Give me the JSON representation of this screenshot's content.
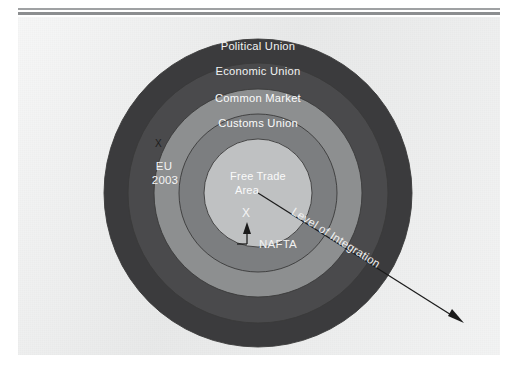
{
  "figure": {
    "type": "concentric-rings-diagram",
    "center": {
      "x": 240,
      "y": 176
    },
    "rings": [
      {
        "id": "political-union",
        "label": "Political Union",
        "radius": 154,
        "fill": "#3b3b3d",
        "label_y": 29
      },
      {
        "id": "economic-union",
        "label": "Economic Union",
        "radius": 130,
        "fill": "#4a4a4c",
        "label_y": 54
      },
      {
        "id": "common-market",
        "label": "Common Market",
        "radius": 104,
        "fill": "#8d8f90",
        "label_y": 81
      },
      {
        "id": "customs-union",
        "label": "Customs Union",
        "radius": 79,
        "fill": "#7c7e80",
        "label_y": 106
      },
      {
        "id": "free-trade-area",
        "label": "Free Trade Area",
        "radius": 54,
        "fill": "#bfc1c2",
        "label_y": 0
      }
    ],
    "center_label_line1": "Free Trade",
    "center_label_line2": "Area",
    "center_marker": "X",
    "annotations": [
      {
        "id": "eu-2003",
        "line1": "EU",
        "line2": "2003",
        "marker": "X",
        "x": 117,
        "y": 139
      },
      {
        "id": "nafta",
        "label": "NAFTA",
        "x": 195,
        "y": 223
      },
      {
        "id": "level-of-integration",
        "label": "Level of Integration",
        "rotation_deg": 32
      }
    ],
    "colors": {
      "page": "#eceded",
      "ring_outer": "#3b3b3d",
      "ring_second": "#4a4a4c",
      "ring_third": "#8d8f90",
      "ring_fourth": "#7c7e80",
      "ring_center": "#bfc1c2",
      "label_text": "#f2f3f3",
      "rule": "#9a9c9e",
      "arrow": "#1b1b1b"
    }
  }
}
